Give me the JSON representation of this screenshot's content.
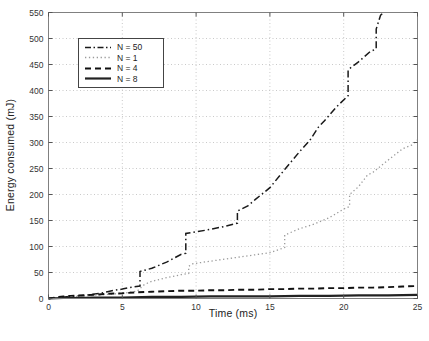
{
  "figure": {
    "background": "#ffffff",
    "box_color": "#808080",
    "tick_color": "#555555",
    "grid_color": "#c9c9c9",
    "tick_label_color": "#333333"
  },
  "chart_data": {
    "type": "line",
    "title": "",
    "xlabel": "Time (ms)",
    "ylabel": "Energy consumed (mJ)",
    "xlim": [
      0,
      25
    ],
    "ylim": [
      0,
      550
    ],
    "xticks": [
      0,
      5,
      10,
      15,
      20,
      25
    ],
    "yticks": [
      0,
      50,
      100,
      150,
      200,
      250,
      300,
      350,
      400,
      450,
      500,
      550
    ],
    "grid": true,
    "legend_position": "top-left",
    "series": [
      {
        "name": "N = 50",
        "style": "dashdot",
        "color": "#1a1a1a",
        "points": [
          [
            0,
            0
          ],
          [
            0.7,
            2
          ],
          [
            1,
            3
          ],
          [
            1.5,
            4
          ],
          [
            2,
            5
          ],
          [
            2.5,
            6
          ],
          [
            3,
            8
          ],
          [
            3.5,
            10
          ],
          [
            4,
            13
          ],
          [
            4.5,
            16
          ],
          [
            5,
            18
          ],
          [
            5.5,
            21
          ],
          [
            6.2,
            24
          ],
          [
            6.2,
            52
          ],
          [
            7,
            58
          ],
          [
            8,
            70
          ],
          [
            9,
            85
          ],
          [
            9.3,
            87
          ],
          [
            9.3,
            125
          ],
          [
            10,
            128
          ],
          [
            11,
            133
          ],
          [
            12,
            139
          ],
          [
            12.8,
            145
          ],
          [
            12.8,
            168
          ],
          [
            13.5,
            178
          ],
          [
            14,
            190
          ],
          [
            15,
            213
          ],
          [
            16,
            248
          ],
          [
            17,
            282
          ],
          [
            17.7,
            304
          ],
          [
            18.3,
            330
          ],
          [
            18.7,
            342
          ],
          [
            19.5,
            368
          ],
          [
            20.3,
            390
          ],
          [
            20.3,
            440
          ],
          [
            21,
            455
          ],
          [
            21.8,
            475
          ],
          [
            22.2,
            480
          ],
          [
            22.2,
            518
          ],
          [
            22.5,
            545
          ],
          [
            22.7,
            550
          ]
        ]
      },
      {
        "name": "N = 1",
        "style": "dotted",
        "color": "#9a9a9a",
        "points": [
          [
            0,
            0
          ],
          [
            1,
            2
          ],
          [
            2,
            4
          ],
          [
            3,
            6
          ],
          [
            4,
            8
          ],
          [
            5,
            10
          ],
          [
            6,
            14
          ],
          [
            6.5,
            27
          ],
          [
            7,
            33
          ],
          [
            8,
            40
          ],
          [
            9,
            46
          ],
          [
            9.5,
            48
          ],
          [
            9.5,
            62
          ],
          [
            9.8,
            67
          ],
          [
            11,
            72
          ],
          [
            12,
            76
          ],
          [
            13,
            80
          ],
          [
            14,
            84
          ],
          [
            15,
            88
          ],
          [
            16,
            98
          ],
          [
            16,
            122
          ],
          [
            16.4,
            127
          ],
          [
            17,
            134
          ],
          [
            18,
            143
          ],
          [
            19,
            155
          ],
          [
            20,
            172
          ],
          [
            20.4,
            177
          ],
          [
            20.4,
            200
          ],
          [
            21,
            215
          ],
          [
            21.6,
            237
          ],
          [
            22,
            243
          ],
          [
            23,
            266
          ],
          [
            24,
            288
          ],
          [
            24.6,
            295
          ],
          [
            25,
            305
          ]
        ]
      },
      {
        "name": "N = 4",
        "style": "dashed",
        "color": "#111111",
        "points": [
          [
            0,
            0
          ],
          [
            0.7,
            3
          ],
          [
            1,
            4
          ],
          [
            1.5,
            5
          ],
          [
            2,
            6
          ],
          [
            3,
            7
          ],
          [
            4,
            9
          ],
          [
            5,
            10
          ],
          [
            6,
            12
          ],
          [
            7,
            13
          ],
          [
            8,
            14
          ],
          [
            9,
            15
          ],
          [
            10,
            15
          ],
          [
            11,
            16
          ],
          [
            12,
            16
          ],
          [
            13,
            17
          ],
          [
            14,
            17
          ],
          [
            15,
            18
          ],
          [
            16,
            18
          ],
          [
            17,
            19
          ],
          [
            18,
            19
          ],
          [
            19,
            20
          ],
          [
            20,
            20
          ],
          [
            21,
            21
          ],
          [
            22,
            21
          ],
          [
            23,
            22
          ],
          [
            24,
            23
          ],
          [
            25,
            24
          ]
        ]
      },
      {
        "name": "N = 8",
        "style": "solid",
        "color": "#222222",
        "points": [
          [
            0,
            0
          ],
          [
            1,
            1
          ],
          [
            2,
            1
          ],
          [
            3,
            2
          ],
          [
            5,
            2
          ],
          [
            7,
            3
          ],
          [
            9,
            3
          ],
          [
            11,
            4
          ],
          [
            13,
            4
          ],
          [
            15,
            4
          ],
          [
            17,
            5
          ],
          [
            19,
            5
          ],
          [
            21,
            6
          ],
          [
            23,
            6
          ],
          [
            25,
            7
          ]
        ]
      }
    ]
  }
}
